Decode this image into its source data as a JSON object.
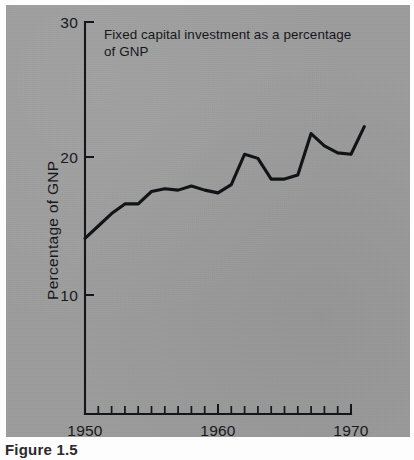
{
  "figure": {
    "caption": "Figure 1.5",
    "paper_color": "#9d9d9d",
    "ink_color": "#15161a"
  },
  "chart_data": {
    "type": "line",
    "title": "Fixed capital investment as a percentage of GNP",
    "title_line1": "Fixed capital investment as a percentage",
    "title_line2": "of GNP",
    "xlabel": "",
    "ylabel": "Percentage of GNP",
    "xlim": [
      1950,
      1970
    ],
    "ylim": [
      0,
      30
    ],
    "grid": false,
    "legend": null,
    "y_ticks": [
      10,
      20,
      30
    ],
    "y_tick_labels": [
      "10",
      "20",
      "30"
    ],
    "x_ticks": [
      1950,
      1951,
      1952,
      1953,
      1954,
      1955,
      1956,
      1957,
      1958,
      1959,
      1960,
      1961,
      1962,
      1963,
      1964,
      1965,
      1966,
      1967,
      1968,
      1969,
      1970
    ],
    "x_tick_labels": [
      "1950",
      "",
      "",
      "",
      "",
      "",
      "",
      "",
      "",
      "",
      "1960",
      "",
      "",
      "",
      "",
      "",
      "",
      "",
      "",
      "",
      "1970"
    ],
    "x_labeled_ticks": [
      "1950",
      "1960",
      "1970"
    ],
    "x": [
      1950,
      1951,
      1952,
      1953,
      1954,
      1955,
      1956,
      1957,
      1958,
      1959,
      1960,
      1961,
      1962,
      1963,
      1964,
      1965,
      1966,
      1967,
      1968,
      1969,
      1970
    ],
    "values": [
      14.1,
      15.0,
      15.9,
      16.6,
      16.7,
      17.5,
      17.8,
      17.7,
      18.0,
      17.7,
      17.5,
      18.0,
      20.2,
      19.9,
      18.4,
      18.5,
      18.8,
      21.7,
      20.9,
      20.3,
      20.2
    ],
    "series": [
      {
        "name": "Fixed capital investment as a percentage of GNP",
        "color": "#121317",
        "points": [
          {
            "x": 1950,
            "y": 14.1
          },
          {
            "x": 1951,
            "y": 15.0
          },
          {
            "x": 1952,
            "y": 15.9
          },
          {
            "x": 1953,
            "y": 16.6
          },
          {
            "x": 1954,
            "y": 16.6
          },
          {
            "x": 1955,
            "y": 17.5
          },
          {
            "x": 1956,
            "y": 17.7
          },
          {
            "x": 1957,
            "y": 17.6
          },
          {
            "x": 1958,
            "y": 17.9
          },
          {
            "x": 1959,
            "y": 17.6
          },
          {
            "x": 1960,
            "y": 17.4
          },
          {
            "x": 1961,
            "y": 18.0
          },
          {
            "x": 1962,
            "y": 20.2
          },
          {
            "x": 1963,
            "y": 19.9
          },
          {
            "x": 1964,
            "y": 18.4
          },
          {
            "x": 1965,
            "y": 18.4
          },
          {
            "x": 1966,
            "y": 18.7
          },
          {
            "x": 1967,
            "y": 21.7
          },
          {
            "x": 1968,
            "y": 20.8
          },
          {
            "x": 1969,
            "y": 20.3
          },
          {
            "x": 1970,
            "y": 20.2
          },
          {
            "x": 1971,
            "y": 22.2
          }
        ]
      }
    ]
  }
}
